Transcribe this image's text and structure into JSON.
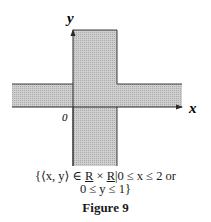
{
  "figure": {
    "axis_labels": {
      "x": "x",
      "y": "y",
      "origin": "0"
    },
    "region": {
      "vertical_band": {
        "x_min": 0,
        "x_max": 2
      },
      "horizontal_band": {
        "y_min": 0,
        "y_max": 1
      }
    },
    "colors": {
      "fill": "#c4c4c4",
      "stroke": "#2a2a2a"
    }
  },
  "caption": {
    "set_line1_prefix": "{⟨x, y⟩ ∈ ",
    "set_R1": "R",
    "set_times": " × ",
    "set_R2": "R",
    "set_line1_suffix": "|0 ≤ x ≤ 2 or",
    "set_line2": "0 ≤ y ≤ 1}",
    "figure_label": "Figure 9"
  }
}
